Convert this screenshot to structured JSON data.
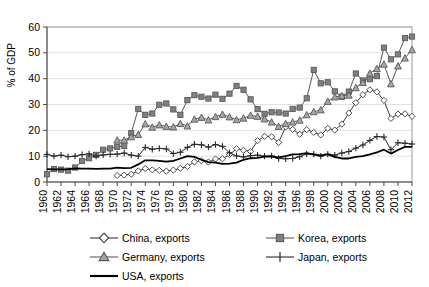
{
  "chart_data": {
    "type": "line",
    "title": "",
    "xlabel": "",
    "ylabel": "% of GDP",
    "xlim": [
      1960,
      2012
    ],
    "ylim": [
      0,
      60
    ],
    "yticks": [
      0,
      10,
      20,
      30,
      40,
      50,
      60
    ],
    "ytick_labels": [
      "0",
      "10",
      "20",
      "30",
      "40",
      "50",
      "60"
    ],
    "grid": true,
    "legend_position": "below",
    "x": [
      1960,
      1961,
      1962,
      1963,
      1964,
      1965,
      1966,
      1967,
      1968,
      1969,
      1970,
      1971,
      1972,
      1973,
      1974,
      1975,
      1976,
      1977,
      1978,
      1979,
      1980,
      1981,
      1982,
      1983,
      1984,
      1985,
      1986,
      1987,
      1988,
      1989,
      1990,
      1991,
      1992,
      1993,
      1994,
      1995,
      1996,
      1997,
      1998,
      1999,
      2000,
      2001,
      2002,
      2003,
      2004,
      2005,
      2006,
      2007,
      2008,
      2009,
      2010,
      2011,
      2012
    ],
    "xtick_labels": [
      "1960",
      "1962",
      "1964",
      "1966",
      "1968",
      "1970",
      "1972",
      "1974",
      "1976",
      "1978",
      "1980",
      "1982",
      "1984",
      "1986",
      "1988",
      "1990",
      "1992",
      "1994",
      "1996",
      "1998",
      "2000",
      "2002",
      "2004",
      "2006",
      "2008",
      "2010",
      "2012"
    ],
    "series": [
      {
        "name": "China, exports",
        "marker": "open-diamond",
        "color": "#3b3b3b",
        "fill": "#ffffff",
        "values": [
          null,
          null,
          null,
          null,
          null,
          null,
          null,
          null,
          null,
          null,
          2.5,
          2.7,
          3.0,
          4.3,
          5.2,
          4.7,
          4.5,
          4.2,
          4.6,
          5.3,
          6.0,
          7.8,
          8.2,
          7.7,
          8.9,
          9.0,
          10.6,
          12.9,
          12.3,
          11.8,
          16.0,
          17.7,
          17.5,
          15.3,
          21.3,
          20.4,
          18.5,
          20.3,
          19.2,
          18.2,
          20.8,
          20.1,
          22.4,
          26.7,
          30.7,
          33.8,
          35.7,
          34.9,
          31.6,
          24.6,
          26.3,
          26.4,
          25.4
        ]
      },
      {
        "name": "Korea, exports",
        "marker": "filled-square",
        "color": "#595959",
        "fill": "#808080",
        "values": [
          3.0,
          5.0,
          4.8,
          4.4,
          5.6,
          8.1,
          9.2,
          10.5,
          12.5,
          13.0,
          13.6,
          14.0,
          18.9,
          28.3,
          26.0,
          26.5,
          29.9,
          30.4,
          28.1,
          26.0,
          31.7,
          33.6,
          33.0,
          32.3,
          33.8,
          32.2,
          34.2,
          37.2,
          35.7,
          32.0,
          28.2,
          26.4,
          27.0,
          26.9,
          26.5,
          28.3,
          28.8,
          32.4,
          43.4,
          38.2,
          38.6,
          35.1,
          33.0,
          35.0,
          42.0,
          39.3,
          39.8,
          41.0,
          52.0,
          47.5,
          49.4,
          55.7,
          56.3
        ]
      },
      {
        "name": "Germany, exports",
        "marker": "filled-triangle",
        "color": "#595959",
        "fill": "#a6a6a6",
        "values": [
          null,
          null,
          null,
          null,
          null,
          null,
          null,
          null,
          null,
          null,
          16.2,
          16.2,
          17.5,
          18.4,
          22.5,
          21.2,
          22.1,
          21.5,
          21.3,
          22.6,
          21.7,
          24.3,
          25.0,
          24.0,
          25.3,
          26.2,
          25.2,
          24.1,
          24.7,
          25.8,
          25.4,
          24.4,
          23.2,
          21.5,
          22.6,
          23.2,
          23.9,
          26.0,
          27.2,
          27.9,
          31.2,
          32.9,
          33.4,
          33.6,
          36.5,
          38.5,
          42.1,
          43.9,
          45.6,
          38.0,
          44.9,
          48.0,
          51.2
        ]
      },
      {
        "name": "Japan, exports",
        "marker": "plus",
        "color": "#2b2b2b",
        "fill": "none",
        "values": [
          10.7,
          10.0,
          10.4,
          9.8,
          10.0,
          10.6,
          10.9,
          10.0,
          10.5,
          10.7,
          10.8,
          11.2,
          10.4,
          10.0,
          13.4,
          12.7,
          13.0,
          12.8,
          11.0,
          11.5,
          13.4,
          14.6,
          14.4,
          13.5,
          14.5,
          13.8,
          11.3,
          10.1,
          9.7,
          10.2,
          10.4,
          10.0,
          10.1,
          9.1,
          9.0,
          9.1,
          9.8,
          10.9,
          10.8,
          10.0,
          10.8,
          10.4,
          11.2,
          11.8,
          13.1,
          14.3,
          16.1,
          17.6,
          17.4,
          12.5,
          15.2,
          15.0,
          14.7
        ]
      },
      {
        "name": "USA, exports",
        "marker": "none",
        "color": "#000000",
        "fill": "none",
        "values": [
          5.0,
          4.9,
          4.9,
          5.0,
          5.3,
          5.2,
          5.2,
          5.1,
          5.2,
          5.2,
          5.6,
          5.4,
          5.5,
          6.8,
          8.4,
          8.4,
          8.2,
          7.9,
          8.2,
          9.1,
          10.0,
          9.7,
          8.6,
          7.7,
          7.5,
          7.0,
          7.1,
          7.5,
          8.6,
          9.2,
          9.3,
          9.8,
          9.8,
          9.5,
          10.0,
          10.7,
          10.8,
          11.2,
          10.6,
          10.3,
          10.7,
          9.7,
          9.1,
          9.1,
          9.7,
          10.0,
          10.7,
          11.5,
          12.5,
          11.0,
          12.4,
          13.6,
          13.6
        ]
      }
    ]
  },
  "legend": {
    "items": [
      {
        "label": "China, exports",
        "key": "open-diamond"
      },
      {
        "label": "Korea, exports",
        "key": "filled-square"
      },
      {
        "label": "Germany, exports",
        "key": "filled-triangle"
      },
      {
        "label": "Japan, exports",
        "key": "plus"
      },
      {
        "label": "USA, exports",
        "key": "plain-line"
      }
    ]
  }
}
